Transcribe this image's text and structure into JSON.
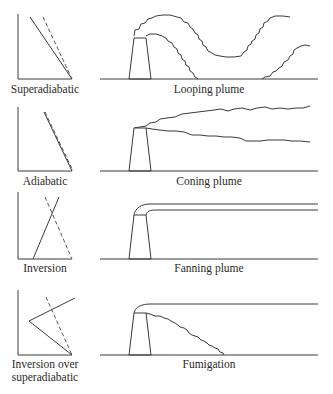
{
  "figure": {
    "width": 333,
    "height": 394,
    "line_color": "#3a3a3a",
    "background": "#ffffff"
  },
  "rows": [
    {
      "id": "looping",
      "lapse_label": [
        "Superadiabatic"
      ],
      "plume_label": "Looping plume",
      "lapse": {
        "axis": {
          "x": 18,
          "top": 14,
          "bottom": 79,
          "right": 72
        },
        "environment_line": [
          [
            30,
            17
          ],
          [
            72,
            79
          ]
        ],
        "adiabatic_line": [
          [
            43,
            17
          ],
          [
            72,
            79
          ]
        ],
        "label_y": 93
      },
      "plume": {
        "ground": {
          "y": 79,
          "x1": 100,
          "x2": 318
        },
        "stack": {
          "base_left": 129,
          "base_right": 151,
          "top_left": 134,
          "top_right": 146,
          "top_y": 38
        },
        "outlines": [
          "M134,36 L135,30 L139,29 L141,24 L145,23 L148,19 L152,18 L156,16 L163,15 L170,15 L177,17 L181,18 L184,22 L188,23 L190,27 L193,29 L195,33 L198,35 L199,39 L202,41 L203,45 L206,47 L208,51 L212,53 L215,55 L220,56 L226,57 L234,57 L241,56 L244,52 L247,50 L248,46 L251,44 L252,41 L255,39 L256,35 L259,33 L260,29 L263,27 L264,23 L268,21 L270,18 L275,16 L283,16 L290,17",
          "M146,36 L150,34 L156,34 L162,36 L166,38 L168,41 L172,43 L174,47 L177,49 L178,53 L181,55 L182,59 L185,61 L186,65 L189,67 L190,71 L193,73 L195,77 L198,79",
          "M262,79 L265,77 L270,76 L273,72 L276,71 L279,68 L282,66 L284,62 L288,60 L290,56 L293,54 L294,50 L297,48 L301,46 L305,45 L310,46"
        ]
      }
    },
    {
      "id": "coning",
      "lapse_label": [
        "Adiabatic"
      ],
      "plume_label": "Coning plume",
      "lapse": {
        "axis": {
          "x": 18,
          "top": 107,
          "bottom": 171,
          "right": 72
        },
        "environment_line": [
          [
            44,
            112
          ],
          [
            72,
            171
          ]
        ],
        "adiabatic_line": [
          [
            45,
            112
          ],
          [
            73,
            171
          ]
        ],
        "label_y": 185
      },
      "plume": {
        "ground": {
          "y": 171,
          "x1": 100,
          "x2": 318
        },
        "stack": {
          "base_left": 129,
          "base_right": 151,
          "top_left": 134,
          "top_right": 146,
          "top_y": 128
        },
        "outlines": [
          "M134,128 L140,127 L146,126 L150,123 L156,122 L160,119 L167,118 L175,117 L182,114 L190,113 L198,112 L206,111 L214,110 L221,109 L228,111 L234,109 L242,108 L250,110 L257,108 L265,107 L272,109 L280,108 L288,109 L296,108 L303,108 L310,106",
          "M146,128 L152,129 L160,130 L168,131 L176,131 L184,132 L192,135 L200,135 L208,136 L216,136 L224,137 L232,137 L240,138 L246,141 L252,141 L260,141 L268,140 L276,140 L284,140 L292,141 L300,141 L310,142"
        ]
      }
    },
    {
      "id": "fanning",
      "lapse_label": [
        "Inversion"
      ],
      "plume_label": "Fanning plume",
      "lapse": {
        "axis": {
          "x": 18,
          "top": 192,
          "bottom": 259,
          "right": 72
        },
        "environment_line": [
          [
            33,
            259
          ],
          [
            59,
            197
          ]
        ],
        "adiabatic_line": [
          [
            45,
            197
          ],
          [
            72,
            259
          ]
        ],
        "label_y": 272
      },
      "plume": {
        "ground": {
          "y": 259,
          "x1": 100,
          "x2": 318
        },
        "stack": {
          "base_left": 129,
          "base_right": 151,
          "top_left": 134,
          "top_right": 146,
          "top_y": 215
        },
        "outlines": [
          "M134,215 C135,208 142,204 150,204 L318,204",
          "M146,215 C147,211 150,210 156,210 L318,210"
        ]
      }
    },
    {
      "id": "fumigation",
      "lapse_label": [
        "Inversion over",
        "superadiabatic"
      ],
      "plume_label": "Fumigation",
      "lapse": {
        "axis": {
          "x": 18,
          "top": 290,
          "bottom": 355,
          "right": 72
        },
        "environment_line": [
          [
            72,
            355
          ],
          [
            29,
            321
          ],
          [
            75,
            298
          ]
        ],
        "adiabatic_line": [
          [
            46,
            297
          ],
          [
            72,
            355
          ]
        ],
        "label_y": 368,
        "label_y2": 381
      },
      "plume": {
        "ground": {
          "y": 355,
          "x1": 100,
          "x2": 318
        },
        "stack": {
          "base_left": 129,
          "base_right": 151,
          "top_left": 134,
          "top_right": 146,
          "top_y": 313
        },
        "outlines": [
          "M134,313 C135,307 142,304 150,304 L318,304",
          "M146,313 L150,314 L155,316 L160,316 L164,318 L168,319 L171,321 L175,323 L178,325 L180,327 L184,328 L187,330 L189,333 L192,335 L195,336 L198,337 L201,340 L204,341 L207,343 L209,345 L212,346 L215,348 L218,349 L220,352 L223,353 L224,355"
        ]
      }
    }
  ]
}
